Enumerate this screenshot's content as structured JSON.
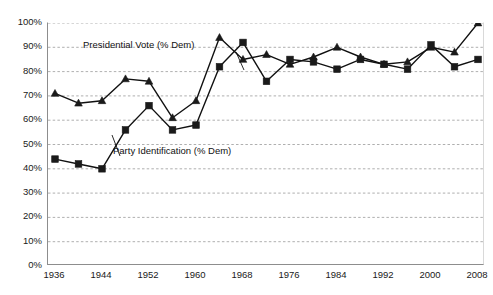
{
  "chart_data": {
    "type": "line",
    "title": "",
    "subtitle": "",
    "xlabel": "",
    "ylabel": "",
    "xlim": [
      1936,
      2008
    ],
    "ylim": [
      0,
      1.0
    ],
    "grid": true,
    "grid_axis": "y",
    "grid_style": "dashed",
    "legend": "inline-annotations",
    "x": [
      1936,
      1940,
      1944,
      1948,
      1952,
      1956,
      1960,
      1964,
      1968,
      1972,
      1976,
      1980,
      1984,
      1988,
      1992,
      1996,
      2000,
      2004,
      2008
    ],
    "x_tick_labels": [
      "1936",
      "1944",
      "1952",
      "1960",
      "1968",
      "1976",
      "1984",
      "1992",
      "2000",
      "2008"
    ],
    "x_ticks": [
      1936,
      1944,
      1952,
      1960,
      1968,
      1976,
      1984,
      1992,
      2000,
      2008
    ],
    "x_minor_ticks": [
      1940,
      1948,
      1956,
      1964,
      1972,
      1980,
      1988,
      1996,
      2004
    ],
    "y_tick_labels": [
      "0%",
      "10%",
      "20%",
      "30%",
      "40%",
      "50%",
      "60%",
      "70%",
      "80%",
      "90%",
      "100%"
    ],
    "y_ticks": [
      0,
      10,
      20,
      30,
      40,
      50,
      60,
      70,
      80,
      90,
      100
    ],
    "series": [
      {
        "name": "Presidential Vote (% Dem)",
        "marker": "triangle",
        "color": "#111111",
        "annotation": "Presidential Vote (% Dem)",
        "values": [
          71,
          67,
          68,
          77,
          76,
          61,
          68,
          94,
          85,
          87,
          83,
          86,
          90,
          86,
          83,
          84,
          90,
          88,
          100
        ]
      },
      {
        "name": "Party Identification (% Dem)",
        "marker": "square",
        "color": "#111111",
        "annotation": "Party Identification (% Dem)",
        "values": [
          44,
          42,
          40,
          56,
          66,
          56,
          58,
          82,
          92,
          76,
          85,
          84,
          81,
          85,
          83,
          81,
          91,
          82,
          85
        ]
      }
    ]
  },
  "annotations": {
    "presidential_vote": "Presidential Vote (% Dem)",
    "party_identification": "Party Identification (% Dem)"
  },
  "colors": {
    "series_line": "#111111",
    "marker_fill": "#1a1a1a",
    "gridline": "#9a9a9a",
    "axis": "#8d8d8d",
    "tick_label": "#1a1a1a",
    "background": "#ffffff"
  }
}
